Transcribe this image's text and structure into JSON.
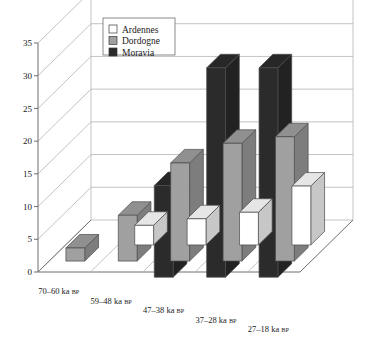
{
  "chart_data": {
    "type": "bar",
    "title": "",
    "subtitle": "",
    "xlabel": "",
    "ylabel": "",
    "ylim": [
      0,
      35
    ],
    "ytick_step": 5,
    "yticks": [
      0,
      5,
      10,
      15,
      20,
      25,
      30,
      35
    ],
    "grid": true,
    "projection": "3d",
    "legend_position": "top-left-inside",
    "categories": [
      "70–60 ka BP",
      "59–48 ka BP",
      "47–38 ka BP",
      "37–28 ka BP",
      "27–18 ka BP"
    ],
    "category_parts": [
      {
        "range": "70–60",
        "unit": "ka",
        "suffix": "BP"
      },
      {
        "range": "59–48",
        "unit": "ka",
        "suffix": "BP"
      },
      {
        "range": "47–38",
        "unit": "ka",
        "suffix": "BP"
      },
      {
        "range": "37–28",
        "unit": "ka",
        "suffix": "BP"
      },
      {
        "range": "27–18",
        "unit": "ka",
        "suffix": "BP"
      }
    ],
    "series": [
      {
        "name": "Ardennes",
        "color": "#ffffff",
        "values": [
          0,
          3,
          4,
          5,
          9
        ]
      },
      {
        "name": "Dordogne",
        "color": "#a0a0a0",
        "values": [
          2,
          7,
          15,
          18,
          19
        ]
      },
      {
        "name": "Moravia",
        "color": "#2b2b2b",
        "values": [
          0,
          0,
          14,
          32,
          32
        ]
      }
    ]
  },
  "legend": {
    "entries": [
      {
        "label": "Ardennes",
        "color": "#ffffff"
      },
      {
        "label": "Dordogne",
        "color": "#a0a0a0"
      },
      {
        "label": "Moravia",
        "color": "#2b2b2b"
      }
    ]
  },
  "axis": {
    "y_tick_labels": [
      "0",
      "5",
      "10",
      "15",
      "20",
      "25",
      "30",
      "35"
    ]
  }
}
